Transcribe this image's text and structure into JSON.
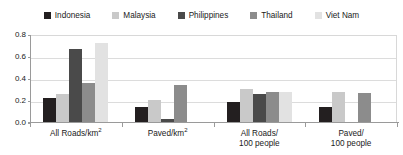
{
  "chart_data": {
    "type": "bar",
    "title": "",
    "subtitle": "",
    "xlabel": "",
    "ylabel": "",
    "ylim": [
      0.0,
      0.8
    ],
    "yticks": [
      "0.0",
      "0.2",
      "0.4",
      "0.6",
      "0.8"
    ],
    "ytick_values": [
      0.0,
      0.2,
      0.4,
      0.6,
      0.8
    ],
    "grid": true,
    "legend_position": "top",
    "categories": [
      "All Roads/km²",
      "Paved/km²",
      "All Roads/\n100 people",
      "Paved/\n100 people"
    ],
    "category_labels": [
      {
        "line1": "All Roads/km",
        "sup": "2",
        "line2": ""
      },
      {
        "line1": "Paved/km",
        "sup": "2",
        "line2": ""
      },
      {
        "line1": "All Roads/",
        "sup": "",
        "line2": "100 people"
      },
      {
        "line1": "Paved/",
        "sup": "",
        "line2": "100 people"
      }
    ],
    "series": [
      {
        "name": "Indonesia",
        "color": "#231f20",
        "values": [
          0.23,
          0.15,
          0.19,
          0.15
        ]
      },
      {
        "name": "Malaysia",
        "color": "#c9c9c9",
        "values": [
          0.26,
          0.21,
          0.31,
          0.28
        ]
      },
      {
        "name": "Philippines",
        "color": "#4a4a4a",
        "values": [
          0.67,
          0.04,
          0.26,
          0.01
        ]
      },
      {
        "name": "Thailand",
        "color": "#8c8c8c",
        "values": [
          0.36,
          0.35,
          0.28,
          0.27
        ]
      },
      {
        "name": "Viet Nam",
        "color": "#e2e2e2",
        "values": [
          0.73,
          0.01,
          0.28,
          0.01
        ]
      }
    ]
  },
  "colors": {
    "axis": "#9a9a9a",
    "grid": "#dcdcdc",
    "frame": "#d8d8d8",
    "text": "#1a1a1a",
    "background": "#ffffff"
  }
}
